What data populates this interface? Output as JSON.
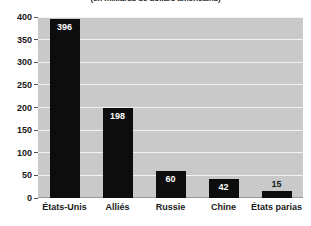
{
  "chart_data": {
    "type": "bar",
    "title": "",
    "subtitle": "(en milliards de dollars américains)",
    "xlabel": "",
    "ylabel": "",
    "categories": [
      "États-Unis",
      "Alliés",
      "Russie",
      "Chine",
      "États parias"
    ],
    "values": [
      396,
      198,
      60,
      42,
      15
    ],
    "value_labels": [
      "396",
      "198",
      "60",
      "42",
      "15"
    ],
    "label_placement": [
      "inside",
      "inside",
      "inside",
      "inside",
      "above"
    ],
    "ylim": [
      0,
      400
    ],
    "yticks": [
      0,
      50,
      100,
      150,
      200,
      250,
      300,
      350,
      400
    ],
    "ytick_labels": [
      "0",
      "50",
      "100",
      "150",
      "200",
      "250",
      "300",
      "350",
      "400"
    ],
    "grid": true,
    "legend": false,
    "colors": {
      "bar": "#0d0d0d",
      "plot_background": "#c9c9c9",
      "gridline": "#f2f2f2",
      "figure_background": "#ffffff",
      "text": "#1a1a1a",
      "value_label_inside": "#ffffff"
    }
  }
}
